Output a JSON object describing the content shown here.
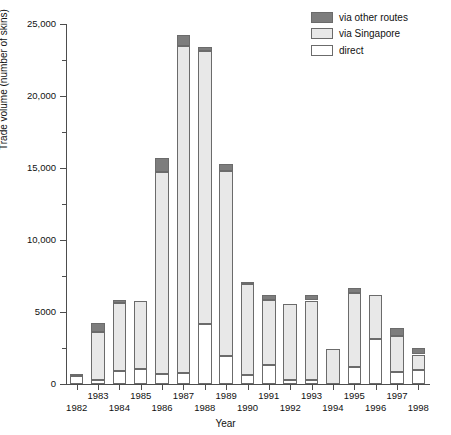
{
  "chart_data": {
    "type": "bar",
    "stacked": true,
    "title": "",
    "xlabel": "Year",
    "ylabel": "Trade volume (number of skins)",
    "ylim": [
      0,
      25000
    ],
    "ytick_values": [
      0,
      5000,
      10000,
      15000,
      20000,
      25000
    ],
    "ytick_labels": [
      "0",
      "5000",
      "10,000",
      "15,000",
      "20,000",
      "25,000"
    ],
    "yminor_interval": 2500,
    "grid": false,
    "legend_position": "top-right",
    "categories": [
      "1982",
      "1983",
      "1984",
      "1985",
      "1986",
      "1987",
      "1988",
      "1989",
      "1990",
      "1991",
      "1992",
      "1993",
      "1994",
      "1995",
      "1996",
      "1997",
      "1998"
    ],
    "series": [
      {
        "name": "direct",
        "color": "#ffffff",
        "values": [
          550,
          300,
          900,
          1050,
          700,
          750,
          4200,
          1950,
          600,
          1350,
          250,
          250,
          0,
          1200,
          3100,
          800,
          1000
        ]
      },
      {
        "name": "via Singapore",
        "color": "#e8e8e8",
        "values": [
          150,
          3300,
          4700,
          4750,
          14050,
          22700,
          18900,
          12850,
          6350,
          4450,
          5300,
          5550,
          2400,
          5150,
          3100,
          2500,
          1050
        ]
      },
      {
        "name": "via other routes",
        "color": "#7d7d7d",
        "values": [
          0,
          650,
          250,
          0,
          950,
          800,
          300,
          500,
          100,
          350,
          0,
          350,
          0,
          300,
          0,
          600,
          450
        ]
      }
    ],
    "totals": [
      700,
      4250,
      5850,
      5800,
      15700,
      24250,
      23400,
      15300,
      7050,
      6150,
      5550,
      6150,
      2400,
      6650,
      6200,
      3900,
      2500
    ]
  },
  "legend": {
    "items": [
      {
        "label": "via other routes"
      },
      {
        "label": "via Singapore"
      },
      {
        "label": "direct"
      }
    ]
  }
}
